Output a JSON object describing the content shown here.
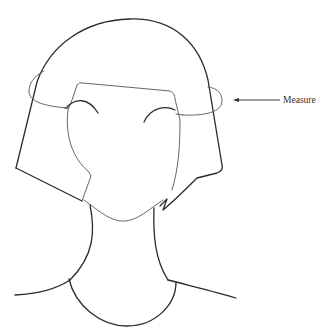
{
  "figure": {
    "annotation": {
      "label": "Measure",
      "arrow_direction": "left"
    },
    "colors": {
      "background": "#ffffff",
      "line": "#2b2b2b",
      "measure_line": "#555555"
    }
  }
}
